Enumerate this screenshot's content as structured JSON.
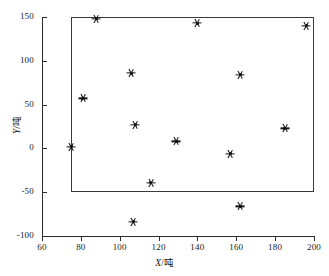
{
  "chart_data": {
    "type": "scatter",
    "title": "",
    "xlabel": "X/吨",
    "ylabel": "Y/吨",
    "xlim": [
      60,
      200
    ],
    "ylim": [
      -100,
      150
    ],
    "xticks": [
      60,
      80,
      100,
      120,
      140,
      160,
      180,
      200
    ],
    "yticks": [
      -100,
      -50,
      0,
      50,
      100,
      150
    ],
    "grid": false,
    "legend": null,
    "marker": "star",
    "marker_color": "#111111",
    "points": [
      {
        "x": 75,
        "y": 2
      },
      {
        "x": 81,
        "y": 57
      },
      {
        "x": 88,
        "y": 148
      },
      {
        "x": 106,
        "y": 86
      },
      {
        "x": 108,
        "y": 27
      },
      {
        "x": 107,
        "y": -84
      },
      {
        "x": 116,
        "y": -39
      },
      {
        "x": 129,
        "y": 8
      },
      {
        "x": 140,
        "y": 143
      },
      {
        "x": 157,
        "y": -6
      },
      {
        "x": 162,
        "y": 84
      },
      {
        "x": 162,
        "y": -66
      },
      {
        "x": 185,
        "y": 23
      },
      {
        "x": 196,
        "y": 140
      }
    ],
    "boundary_box": {
      "label": "boundary-rectangle",
      "x_min": 75,
      "x_max": 200,
      "y_min": -50,
      "y_max": 150,
      "stroke": "#3a3a3a"
    }
  },
  "axis": {
    "x_label_var": "X",
    "x_label_unit": "/吨",
    "y_label_var": "Y",
    "y_label_unit": "/吨"
  }
}
